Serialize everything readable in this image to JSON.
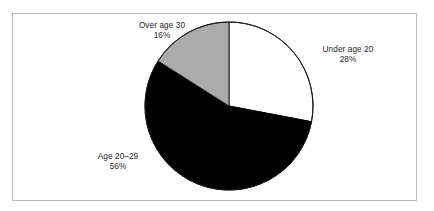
{
  "chart_data": {
    "type": "pie",
    "title": "",
    "subtitle": "",
    "xlabel": "",
    "ylabel": "",
    "legend": "none",
    "grid": false,
    "start_angle_deg": 0,
    "direction": "clockwise",
    "center": {
      "x": 229,
      "y": 106
    },
    "radius": 84,
    "categories": [
      "Under age 20",
      "Age 20-29",
      "Over age 30"
    ],
    "values": [
      28,
      56,
      16
    ],
    "value_unit": "%",
    "slices": [
      {
        "label": "Under age 20",
        "value": 28,
        "value_text": "28%",
        "color": "#ffffff",
        "edge_color": "#1a1a1a",
        "start_deg": 0,
        "end_deg": 100.8
      },
      {
        "label": "Age 20–29",
        "value": 56,
        "value_text": "56%",
        "color": "#000000",
        "edge_color": "#000000",
        "start_deg": 100.8,
        "end_deg": 302.4
      },
      {
        "label": "Over age 30",
        "value": 16,
        "value_text": "16%",
        "color": "#ababab",
        "edge_color": "#1a1a1a",
        "start_deg": 302.4,
        "end_deg": 360
      }
    ]
  },
  "figure": {
    "background": "#ffffff",
    "frame_color": "#b9b9b9",
    "text_color": "#252525"
  },
  "labels": {
    "over_age_30": {
      "name": "Over age 30",
      "pct": "16%"
    },
    "under_age_20": {
      "name": "Under age 20",
      "pct": "28%"
    },
    "age_20_29": {
      "name": "Age 20–29",
      "pct": "56%"
    }
  }
}
